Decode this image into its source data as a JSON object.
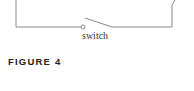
{
  "diagram": {
    "component_label": "switch",
    "line_color": "#8a8a8a"
  },
  "caption": {
    "figure_label": "FIGURE 4"
  }
}
